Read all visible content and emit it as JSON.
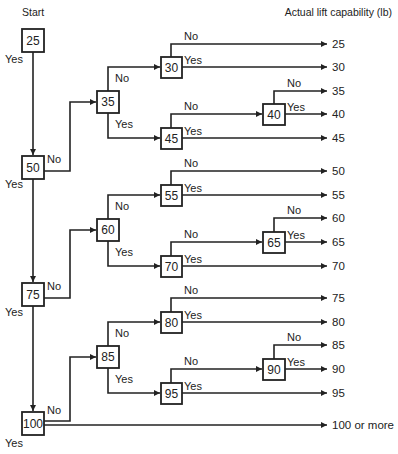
{
  "diagram": {
    "type": "decision-tree-flowchart",
    "start_label": "Start",
    "output_header": "Actual lift capability (lb)",
    "yes_label": "Yes",
    "no_label": "No",
    "nodes": [
      {
        "id": "n25",
        "label": "25"
      },
      {
        "id": "n50",
        "label": "50"
      },
      {
        "id": "n75",
        "label": "75"
      },
      {
        "id": "n100",
        "label": "100"
      },
      {
        "id": "n35",
        "label": "35"
      },
      {
        "id": "n60",
        "label": "60"
      },
      {
        "id": "n85",
        "label": "85"
      },
      {
        "id": "n30",
        "label": "30"
      },
      {
        "id": "n45",
        "label": "45"
      },
      {
        "id": "n55",
        "label": "55"
      },
      {
        "id": "n70",
        "label": "70"
      },
      {
        "id": "n80",
        "label": "80"
      },
      {
        "id": "n95",
        "label": "95"
      },
      {
        "id": "n40",
        "label": "40"
      },
      {
        "id": "n65",
        "label": "65"
      },
      {
        "id": "n90",
        "label": "90"
      }
    ],
    "outcomes": [
      "25",
      "30",
      "35",
      "40",
      "45",
      "50",
      "55",
      "60",
      "65",
      "70",
      "75",
      "80",
      "85",
      "90",
      "95",
      "100 or more"
    ],
    "edges": [
      {
        "from": "n25",
        "to": "n50",
        "label": "Yes"
      },
      {
        "from": "n50",
        "to": "n75",
        "label": "Yes"
      },
      {
        "from": "n75",
        "to": "n100",
        "label": "Yes"
      },
      {
        "from": "n100",
        "to": "100 or more",
        "label": "Yes"
      },
      {
        "from": "n50",
        "to": "n35",
        "label": "No"
      },
      {
        "from": "n75",
        "to": "n60",
        "label": "No"
      },
      {
        "from": "n100",
        "to": "n85",
        "label": "No"
      },
      {
        "from": "n35",
        "to": "n30",
        "label": "No"
      },
      {
        "from": "n35",
        "to": "n45",
        "label": "Yes"
      },
      {
        "from": "n30",
        "to": "25",
        "label": "No"
      },
      {
        "from": "n30",
        "to": "30",
        "label": "Yes"
      },
      {
        "from": "n45",
        "to": "n40",
        "label": "No"
      },
      {
        "from": "n45",
        "to": "45",
        "label": "Yes"
      },
      {
        "from": "n40",
        "to": "35",
        "label": "No"
      },
      {
        "from": "n40",
        "to": "40",
        "label": "Yes"
      },
      {
        "from": "n60",
        "to": "n55",
        "label": "No"
      },
      {
        "from": "n60",
        "to": "n70",
        "label": "Yes"
      },
      {
        "from": "n55",
        "to": "50",
        "label": "No"
      },
      {
        "from": "n55",
        "to": "55",
        "label": "Yes"
      },
      {
        "from": "n70",
        "to": "n65",
        "label": "No"
      },
      {
        "from": "n70",
        "to": "70",
        "label": "Yes"
      },
      {
        "from": "n65",
        "to": "60",
        "label": "No"
      },
      {
        "from": "n65",
        "to": "65",
        "label": "Yes"
      },
      {
        "from": "n85",
        "to": "n80",
        "label": "No"
      },
      {
        "from": "n85",
        "to": "n95",
        "label": "Yes"
      },
      {
        "from": "n80",
        "to": "75",
        "label": "No"
      },
      {
        "from": "n80",
        "to": "80",
        "label": "Yes"
      },
      {
        "from": "n95",
        "to": "n90",
        "label": "No"
      },
      {
        "from": "n95",
        "to": "95",
        "label": "Yes"
      },
      {
        "from": "n90",
        "to": "85",
        "label": "No"
      },
      {
        "from": "n90",
        "to": "90",
        "label": "Yes"
      }
    ]
  }
}
